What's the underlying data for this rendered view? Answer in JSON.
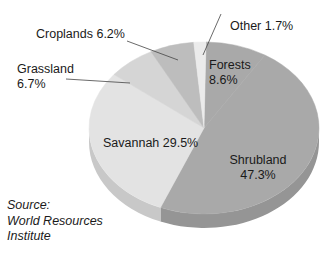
{
  "chart_data": {
    "type": "pie",
    "style": "3d-pie-grayscale",
    "title": "",
    "categories": [
      "Forests",
      "Shrubland",
      "Savannah",
      "Grassland",
      "Croplands",
      "Other"
    ],
    "values": [
      8.6,
      47.3,
      29.5,
      6.7,
      6.2,
      1.7
    ],
    "unit": "%",
    "legend": "none (direct slice labels)",
    "slices": [
      {
        "name": "Forests",
        "value": 8.6,
        "label": "Forests\n8.6%",
        "color": "#a9a9a9"
      },
      {
        "name": "Shrubland",
        "value": 47.3,
        "label": "Shrubland\n47.3%",
        "color": "#a9a9a9"
      },
      {
        "name": "Savannah",
        "value": 29.5,
        "label": "Savannah 29.5%",
        "color": "#e3e3e3"
      },
      {
        "name": "Grassland",
        "value": 6.7,
        "label": "Grassland\n6.7%",
        "color": "#d5d5d5"
      },
      {
        "name": "Croplands",
        "value": 6.2,
        "label": "Croplands 6.2%",
        "color": "#bdbdbd"
      },
      {
        "name": "Other",
        "value": 1.7,
        "label": "Other 1.7%",
        "color": "#ebebeb"
      }
    ],
    "annotations": [
      "Source: World Resources Institute"
    ]
  },
  "labels": {
    "other": "Other 1.7%",
    "croplands": "Croplands 6.2%",
    "grassland_name": "Grassland",
    "grassland_value": "6.7%",
    "forests_name": "Forests",
    "forests_value": "8.6%",
    "savannah": "Savannah 29.5%",
    "shrubland_name": "Shrubland",
    "shrubland_value": "47.3%"
  },
  "source": {
    "line1": "Source:",
    "line2": "World Resources",
    "line3": "Institute"
  }
}
